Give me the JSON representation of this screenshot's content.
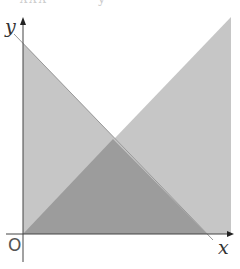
{
  "top_fragment": "ʌʌʌ ˊ   ˊ ˊ   y",
  "axes": {
    "x_label": "x",
    "y_label": "y",
    "origin_label": "O"
  },
  "colors": {
    "light_fill": "#c4c4c4",
    "dark_fill": "#9a9a9a",
    "axis": "#333333",
    "background": "#ffffff"
  },
  "shapes": [
    {
      "name": "left-triangle",
      "points": [
        [
          23,
          43
        ],
        [
          207,
          234
        ],
        [
          23,
          234
        ]
      ]
    },
    {
      "name": "right-triangle",
      "points": [
        [
          231,
          17
        ],
        [
          231,
          234
        ],
        [
          23,
          234
        ]
      ]
    },
    {
      "name": "overlap-triangle",
      "points": [
        [
          113,
          139
        ],
        [
          207,
          234
        ],
        [
          23,
          234
        ]
      ]
    }
  ]
}
